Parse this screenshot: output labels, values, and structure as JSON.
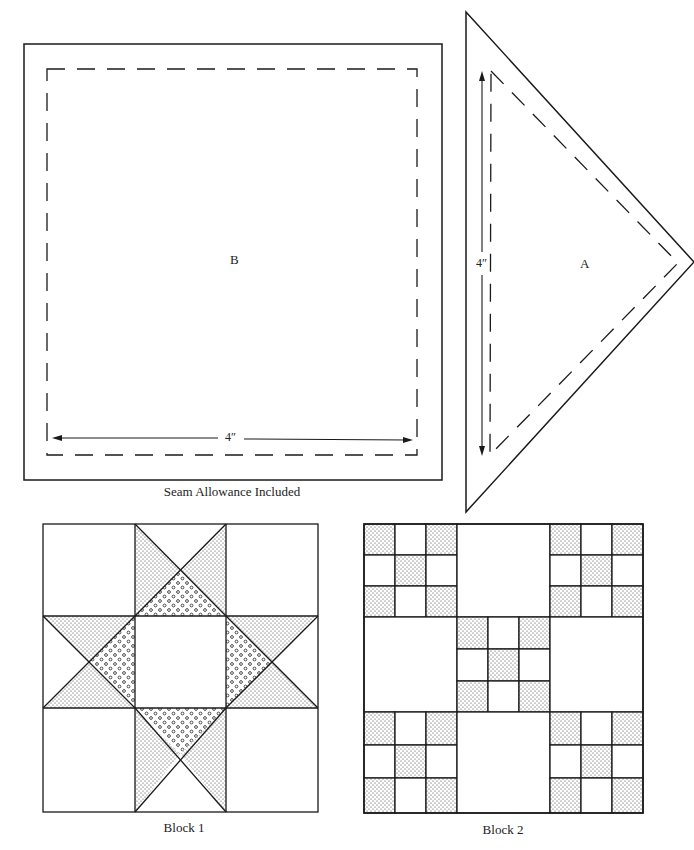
{
  "templates": {
    "square": {
      "letter": "B",
      "dimension": "4″",
      "caption": "Seam Allowance Included"
    },
    "triangle": {
      "letter": "A",
      "dimension": "4″"
    }
  },
  "blocks": [
    {
      "name": "Block 1",
      "pattern": "Ohio Star / Sawtooth Star",
      "grid": "3x3",
      "caption": "Block 1"
    },
    {
      "name": "Block 2",
      "pattern": "Double Nine-Patch",
      "grid": "3x3 with nine-patch sub-blocks",
      "caption": "Block 2"
    }
  ],
  "colors": {
    "line": "#1a1a1a",
    "background": "#ffffff",
    "stipple": "#333333"
  }
}
